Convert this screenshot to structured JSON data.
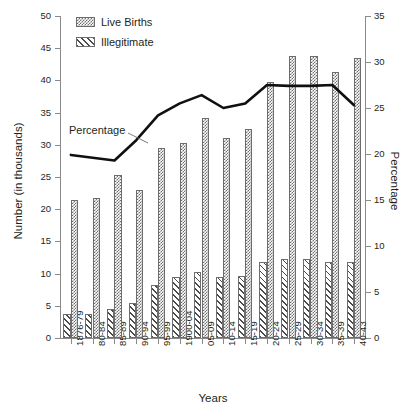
{
  "chart_data": {
    "type": "bar",
    "title": "",
    "xlabel": "Years",
    "ylabel": "Number (in thousands)",
    "y2label": "Percentage",
    "categories": [
      "1876-79",
      "80-84",
      "85-89",
      "90-94",
      "95-99",
      "1900-04",
      "05-09",
      "10-14",
      "15-19",
      "20-24",
      "25-29",
      "30-34",
      "35-39",
      "40-43"
    ],
    "ylim": [
      0,
      50
    ],
    "y2lim": [
      0,
      35
    ],
    "yticks": [
      0,
      5,
      10,
      15,
      20,
      25,
      30,
      35,
      40,
      45,
      50
    ],
    "y2ticks": [
      0,
      5,
      10,
      15,
      20,
      25,
      30,
      35
    ],
    "grid": false,
    "legend_position": "top-left",
    "series": [
      {
        "name": "Live Births",
        "type": "bar",
        "axis": "left",
        "values": [
          21.5,
          21.8,
          25.3,
          23.0,
          29.5,
          30.3,
          34.2,
          31.0,
          32.5,
          39.8,
          43.8,
          43.8,
          41.3,
          43.5
        ]
      },
      {
        "name": "Illegitimate",
        "type": "bar",
        "axis": "left",
        "values": [
          3.8,
          3.7,
          4.5,
          5.5,
          8.2,
          9.5,
          10.2,
          9.5,
          9.7,
          11.8,
          12.3,
          12.3,
          11.8,
          11.8
        ]
      },
      {
        "name": "Percentage",
        "type": "line",
        "axis": "right",
        "values": [
          19.9,
          19.6,
          19.3,
          21.5,
          24.2,
          25.5,
          26.4,
          25.0,
          25.5,
          27.5,
          27.4,
          27.4,
          27.5,
          25.3
        ]
      }
    ],
    "annotations": [
      {
        "text": "Percentage",
        "target_category": "90-94"
      }
    ],
    "colors": {
      "live_births_fill": "#6e6e6e",
      "illegitimate_fill": "#4a4a4a",
      "line": "#101010",
      "axis": "#8a8a8a",
      "text": "#231f20",
      "background": "#ffffff"
    }
  },
  "legend": {
    "items": [
      {
        "label": "Live Births",
        "pattern": "checker"
      },
      {
        "label": "Illegitimate",
        "pattern": "hatch"
      }
    ]
  }
}
